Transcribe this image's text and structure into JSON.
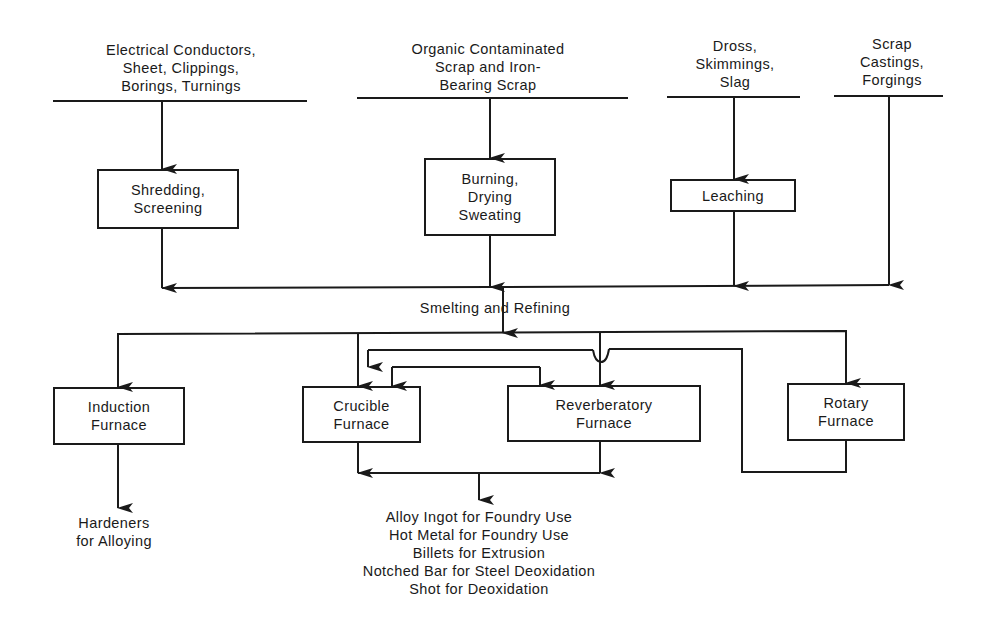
{
  "diagram": {
    "type": "flowchart",
    "inputs": [
      {
        "id": "electrical",
        "lines": [
          "Electrical Conductors,",
          "Sheet, Clippings,",
          "Borings, Turnings"
        ]
      },
      {
        "id": "organic",
        "lines": [
          "Organic Contaminated",
          "Scrap and Iron-",
          "Bearing Scrap"
        ]
      },
      {
        "id": "dross",
        "lines": [
          "Dross,",
          "Skimmings,",
          "Slag"
        ]
      },
      {
        "id": "scrap",
        "lines": [
          "Scrap",
          "Castings,",
          "Forgings"
        ]
      }
    ],
    "pretreatment": [
      {
        "id": "shredding",
        "lines": [
          "Shredding,",
          "Screening"
        ]
      },
      {
        "id": "burning",
        "lines": [
          "Burning,",
          "Drying",
          "Sweating"
        ]
      },
      {
        "id": "leaching",
        "lines": [
          "Leaching"
        ]
      }
    ],
    "stage_label": "Smelting and Refining",
    "furnaces": [
      {
        "id": "induction",
        "lines": [
          "Induction",
          "Furnace"
        ]
      },
      {
        "id": "crucible",
        "lines": [
          "Crucible",
          "Furnace"
        ]
      },
      {
        "id": "reverberatory",
        "lines": [
          "Reverberatory",
          "Furnace"
        ]
      },
      {
        "id": "rotary",
        "lines": [
          "Rotary",
          "Furnace"
        ]
      }
    ],
    "outputs": {
      "induction": [
        "Hardeners",
        "for Alloying"
      ],
      "main": [
        "Alloy Ingot for Foundry Use",
        "Hot Metal for Foundry Use",
        "Billets for Extrusion",
        "Notched Bar for Steel Deoxidation",
        "Shot for Deoxidation"
      ]
    },
    "edges": [
      [
        "electrical",
        "shredding"
      ],
      [
        "organic",
        "burning"
      ],
      [
        "dross",
        "leaching"
      ],
      [
        "shredding",
        "smelting"
      ],
      [
        "burning",
        "smelting"
      ],
      [
        "leaching",
        "smelting"
      ],
      [
        "scrap",
        "smelting"
      ],
      [
        "smelting",
        "induction"
      ],
      [
        "smelting",
        "crucible"
      ],
      [
        "smelting",
        "reverberatory"
      ],
      [
        "smelting",
        "rotary"
      ],
      [
        "rotary",
        "crucible"
      ],
      [
        "rotary",
        "reverberatory"
      ],
      [
        "induction",
        "hardeners"
      ],
      [
        "crucible",
        "main_outputs"
      ],
      [
        "reverberatory",
        "main_outputs"
      ]
    ],
    "line_color": "#1a1a1a"
  }
}
